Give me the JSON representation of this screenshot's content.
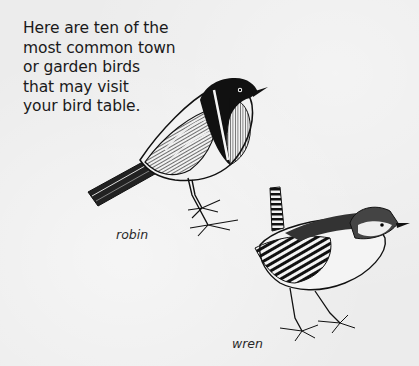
{
  "page": {
    "intro_lines": [
      "Here are ten of the",
      "most common town",
      "or garden birds",
      "that may visit",
      "your bird table."
    ]
  },
  "illustrations": [
    {
      "id": "robin",
      "caption": "robin",
      "icon": "robin-illustration"
    },
    {
      "id": "wren",
      "caption": "wren",
      "icon": "wren-illustration"
    }
  ],
  "colors": {
    "background": "#ececec",
    "ink": "#1a1a1a"
  }
}
